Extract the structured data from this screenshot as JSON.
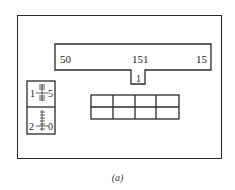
{
  "diagram": {
    "top_bar": {
      "left_label": "50",
      "center_label": "151",
      "right_label": "15",
      "tab_label": "1"
    },
    "left_gauge": {
      "upper": {
        "left_label": "1",
        "right_label": "5"
      },
      "lower": {
        "left_label": "2",
        "right_label": "0"
      }
    },
    "grid": {
      "rows": 2,
      "columns": 4
    },
    "caption": "(a)"
  }
}
